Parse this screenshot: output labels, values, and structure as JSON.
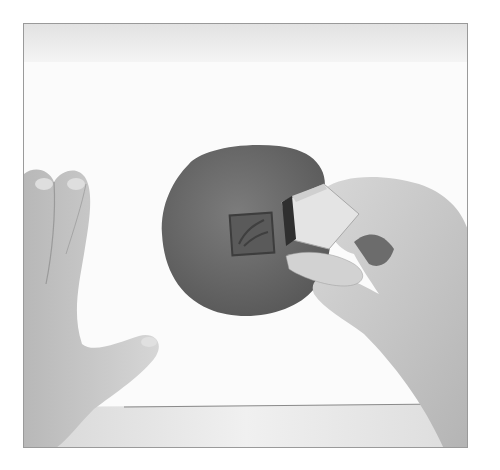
{
  "photo": {
    "description": "Grayscale photo of hands pressing a square rubber stamp into a round disc of clay on white paper",
    "subjects": [
      "left-hand",
      "right-hand",
      "clay-disc",
      "rubber-stamp",
      "stamp-impression",
      "paper-sheet"
    ],
    "colors": {
      "background": "#ffffff",
      "paper": "#fbfbfb",
      "table_band": "#e6e6e6",
      "clay": "#6f6f6f",
      "clay_dark": "#4e4e4e",
      "skin": "#c9c9c9",
      "skin_shadow": "#9e9e9e",
      "stamp_wood": "#e2e2e2",
      "stamp_rubber": "#3a3a3a",
      "frame_border": "#9a9a9a"
    }
  }
}
